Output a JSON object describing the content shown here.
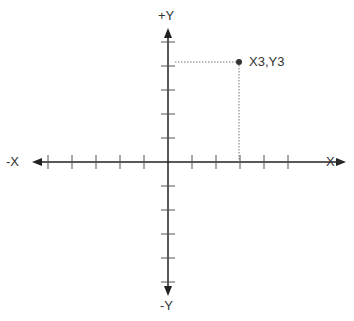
{
  "diagram": {
    "type": "cartesian-plane",
    "axis_labels": {
      "pos_y": "+Y",
      "neg_y": "-Y",
      "neg_x": "-X",
      "pos_x": "X+"
    },
    "origin_px": [
      168,
      162
    ],
    "tick_spacing_px": 24,
    "ticks_per_half_axis": {
      "pos_x": 5,
      "neg_x": 5,
      "pos_y": 5,
      "neg_y": 5
    },
    "point": {
      "label": "X3,Y3",
      "x": 3,
      "y": 4
    },
    "colors": {
      "axis": "#222222",
      "tick": "#555555",
      "guide": "#777777",
      "point": "#333333"
    }
  }
}
